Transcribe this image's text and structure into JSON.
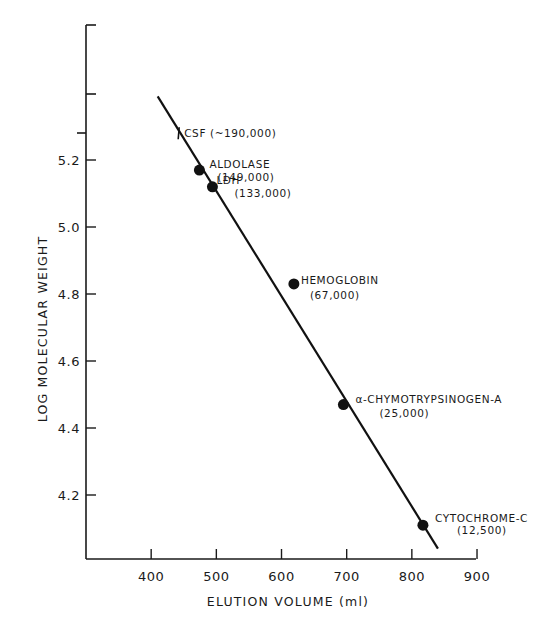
{
  "chart_data": {
    "type": "scatter",
    "title": "",
    "xlabel": "ELUTION VOLUME (ml)",
    "ylabel": "LOG MOLECULAR WEIGHT",
    "xlim": [
      300,
      900
    ],
    "ylim": [
      4.0,
      5.6
    ],
    "x_ticks": [
      400,
      500,
      600,
      700,
      800,
      900
    ],
    "y_ticks": [
      4.2,
      4.4,
      4.6,
      4.8,
      5.0,
      5.2
    ],
    "x_tick_labels": [
      "400",
      "500",
      "600",
      "700",
      "800",
      "900"
    ],
    "y_tick_labels": [
      "4.2",
      "4.4",
      "4.6",
      "4.8",
      "5.0",
      "5.2"
    ],
    "grid": false,
    "legend": null,
    "points": [
      {
        "name": "ALDOLASE",
        "mw_label": "(149,000)",
        "x": 474,
        "y": 5.17
      },
      {
        "name": "LDH",
        "mw_label": "(133,000)",
        "x": 494,
        "y": 5.12
      },
      {
        "name": "HEMOGLOBIN",
        "mw_label": "(67,000)",
        "x": 619,
        "y": 4.83
      },
      {
        "name": "α-CHYMOTRYPSINOGEN-A",
        "mw_label": "(25,000)",
        "x": 695,
        "y": 4.47
      },
      {
        "name": "CYTOCHROME-C",
        "mw_label": "(12,500)",
        "x": 817,
        "y": 4.11
      }
    ],
    "annotation": {
      "name": "CSF",
      "mw_label": "(~190,000)",
      "text": "CSF (~190,000)",
      "x": 443,
      "y": 5.28,
      "marker": "tick"
    },
    "fit_line": {
      "x_start": 410,
      "y_start": 5.39,
      "x_end": 840,
      "y_end": 4.04
    }
  }
}
